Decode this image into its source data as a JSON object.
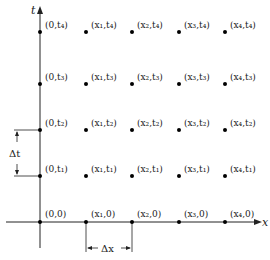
{
  "diagram": {
    "type": "finite-difference-grid",
    "axes": {
      "x_label": "x",
      "t_label": "t"
    },
    "grid": {
      "x_nodes": [
        "0",
        "x1",
        "x2",
        "x3",
        "x4"
      ],
      "t_nodes": [
        "0",
        "t1",
        "t2",
        "t3",
        "t4"
      ]
    },
    "point_labels": [
      [
        "(0,0)",
        "(x₁,0)",
        "(x₂,0)",
        "(x₃,0)",
        "(x₄,0)"
      ],
      [
        "(0,t₁)",
        "(x₁,t₁)",
        "(x₂,t₁)",
        "(x₃,t₁)",
        "(x₄,t₁)"
      ],
      [
        "(0,t₂)",
        "(x₁,t₂)",
        "(x₂,t₂)",
        "(x₃,t₂)",
        "(x₄,t₂)"
      ],
      [
        "(0,t₃)",
        "(x₁,t₃)",
        "(x₂,t₃)",
        "(x₃,t₃)",
        "(x₄,t₃)"
      ],
      [
        "(0,t₄)",
        "(x₁,t₄)",
        "(x₂,t₄)",
        "(x₃,t₄)",
        "(x₄,t₄)"
      ]
    ],
    "dimensions": {
      "dx_label": "Δx",
      "dt_label": "Δt"
    }
  }
}
